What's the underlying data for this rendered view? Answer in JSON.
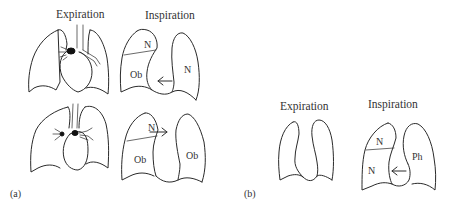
{
  "figure": {
    "panel_a": {
      "label": "(a)",
      "expiration_title": "Expiration",
      "inspiration_title": "Inspiration",
      "rows": [
        {
          "inspiration_regions": {
            "upper_left": "N",
            "lower_left": "Ob",
            "right": "N"
          },
          "arrow_direction": "left"
        },
        {
          "inspiration_regions": {
            "upper_left": "N",
            "lower_left": "Ob",
            "right": "Ob"
          },
          "arrow_direction": "right"
        }
      ]
    },
    "panel_b": {
      "label": "(b)",
      "expiration_title": "Expiration",
      "inspiration_title": "Inspiration",
      "inspiration_regions": {
        "upper_left": "N",
        "lower_left": "N",
        "right": "Ph"
      },
      "arrow_direction": "left"
    }
  }
}
